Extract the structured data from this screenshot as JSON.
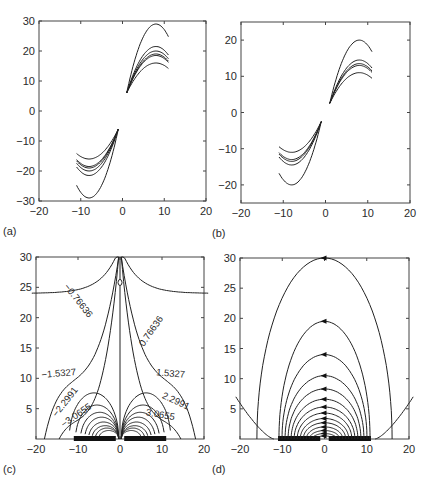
{
  "figure": {
    "panels": [
      "(a)",
      "(b)",
      "(c)",
      "(d)"
    ]
  },
  "chart_data": [
    {
      "id": "a",
      "type": "line",
      "panel_label": "(a)",
      "title": "",
      "xlabel": "",
      "ylabel": "",
      "xlim": [
        -20,
        20
      ],
      "ylim": [
        -30,
        30
      ],
      "xticks": [
        "-20",
        "-10",
        "0",
        "10",
        "20"
      ],
      "yticks": [
        "-30",
        "-20",
        "-10",
        "0",
        "10",
        "20",
        "30"
      ],
      "grid": false,
      "description": "Family of parabola-like arcs, antisymmetric about origin; right branch x 1→11, left branch x -11→-1",
      "series": [
        {
          "name": "outer",
          "peak": 29,
          "x": [
            1,
            4,
            8,
            11
          ],
          "y": [
            6,
            23,
            29,
            23
          ]
        },
        {
          "name": "upper",
          "peak": 21.5,
          "x": [
            1,
            4,
            8,
            11
          ],
          "y": [
            6,
            18,
            21.5,
            17.5
          ]
        },
        {
          "name": "bundle-1",
          "peak": 20,
          "x": [
            1,
            4,
            8,
            11
          ],
          "y": [
            6,
            17,
            20,
            16.5
          ]
        },
        {
          "name": "bundle-2",
          "peak": 19,
          "x": [
            1,
            4,
            8,
            11
          ],
          "y": [
            6,
            16.5,
            19,
            16
          ]
        },
        {
          "name": "bundle-3",
          "peak": 18.5,
          "x": [
            1,
            4,
            8,
            11
          ],
          "y": [
            6,
            16,
            18.5,
            15.5
          ]
        },
        {
          "name": "inner",
          "peak": 16,
          "x": [
            1,
            4,
            8,
            11
          ],
          "y": [
            6,
            14,
            16,
            13
          ]
        }
      ]
    },
    {
      "id": "b",
      "type": "line",
      "panel_label": "(b)",
      "title": "",
      "xlabel": "",
      "ylabel": "",
      "xlim": [
        -20,
        20
      ],
      "ylim": [
        -25,
        25
      ],
      "xticks": [
        "-20",
        "-10",
        "0",
        "10",
        "20"
      ],
      "yticks": [
        "-20",
        "-10",
        "0",
        "10",
        "20"
      ],
      "grid": false,
      "description": "Same family of arcs as (a) with smaller amplitude",
      "series": [
        {
          "name": "outer",
          "peak": 20,
          "x": [
            1,
            4,
            8,
            11
          ],
          "y": [
            2.5,
            15,
            20,
            15.5
          ]
        },
        {
          "name": "upper",
          "peak": 14.5,
          "x": [
            1,
            4,
            8,
            11
          ],
          "y": [
            2.5,
            12,
            14.5,
            11.5
          ]
        },
        {
          "name": "bundle-1",
          "peak": 13.5,
          "x": [
            1,
            4,
            8,
            11
          ],
          "y": [
            2.5,
            11.5,
            13.5,
            11
          ]
        },
        {
          "name": "bundle-2",
          "peak": 13,
          "x": [
            1,
            4,
            8,
            11
          ],
          "y": [
            2.5,
            11,
            13,
            10.5
          ]
        },
        {
          "name": "inner",
          "peak": 11,
          "x": [
            1,
            4,
            8,
            11
          ],
          "y": [
            2.5,
            9.5,
            11,
            8.5
          ]
        }
      ]
    },
    {
      "id": "c",
      "type": "line",
      "subtype": "contour",
      "panel_label": "(c)",
      "title": "",
      "xlabel": "",
      "ylabel": "",
      "xlim": [
        -20,
        20
      ],
      "ylim": [
        0,
        30
      ],
      "xticks": [
        "-20",
        "-10",
        "0",
        "10",
        "20"
      ],
      "yticks": [
        "5",
        "10",
        "15",
        "20",
        "25",
        "30"
      ],
      "grid": false,
      "contour_labels_left": [
        "-0.76636",
        "-1.5327",
        "-2.2991",
        "-3.0655"
      ],
      "contour_labels_right": [
        "0.76636",
        "1.5327",
        "2.2991",
        "3.0655"
      ],
      "zero_label": "0",
      "electrodes": [
        {
          "x_from": -11,
          "x_to": -1
        },
        {
          "x_from": 1,
          "x_to": 11
        }
      ],
      "contour_levels": [
        0.76636,
        1.5327,
        2.2991,
        3.0655
      ]
    },
    {
      "id": "d",
      "type": "line",
      "subtype": "field-lines",
      "panel_label": "(d)",
      "title": "",
      "xlabel": "",
      "ylabel": "",
      "xlim": [
        -20,
        20
      ],
      "ylim": [
        0,
        30
      ],
      "xticks": [
        "-20",
        "-10",
        "0",
        "10",
        "20"
      ],
      "yticks": [
        "5",
        "10",
        "15",
        "20",
        "25",
        "30"
      ],
      "grid": false,
      "description": "Semi-elliptical field lines from right electrode to left electrode with leftward arrows at apex",
      "apex_heights": [
        30,
        19.5,
        14,
        10.5,
        8.3,
        6.6,
        5.3,
        4.3,
        3.4,
        2.7,
        2.0,
        1.4,
        0.9,
        0.5
      ],
      "electrodes": [
        {
          "x_from": -11,
          "x_to": -1
        },
        {
          "x_from": 1,
          "x_to": 11
        }
      ]
    }
  ]
}
